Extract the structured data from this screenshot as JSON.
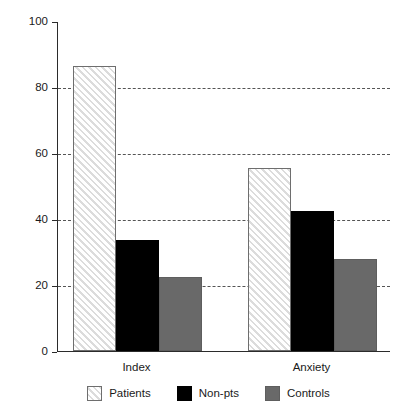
{
  "chart_data": {
    "type": "bar",
    "title": "",
    "subtitle": "",
    "xlabel": "",
    "ylabel": "",
    "categories": [
      "Index",
      "Anxiety"
    ],
    "series": [
      {
        "name": "Patients",
        "values": [
          86.5,
          55.5
        ],
        "color": "#ffffff",
        "pattern": "diagonal-hatch"
      },
      {
        "name": "Non-pts",
        "values": [
          33.5,
          42.5
        ],
        "color": "#000000",
        "pattern": "solid"
      },
      {
        "name": "Controls",
        "values": [
          22.5,
          28.0
        ],
        "color": "#696969",
        "pattern": "solid"
      }
    ],
    "ylim": [
      0,
      100
    ],
    "yticks": [
      0,
      20,
      40,
      60,
      80,
      100
    ],
    "ytick_labels": [
      "0",
      "20",
      "40",
      "60",
      "80",
      "100"
    ],
    "gridlines": {
      "y": [
        20,
        40,
        60,
        80
      ],
      "style": "dashed",
      "color": "#555555"
    },
    "grid": true,
    "legend_position": "bottom",
    "legend": [
      "Patients",
      "Non-pts",
      "Controls"
    ],
    "axis_color": "#2b2b2b",
    "background": "#ffffff"
  }
}
